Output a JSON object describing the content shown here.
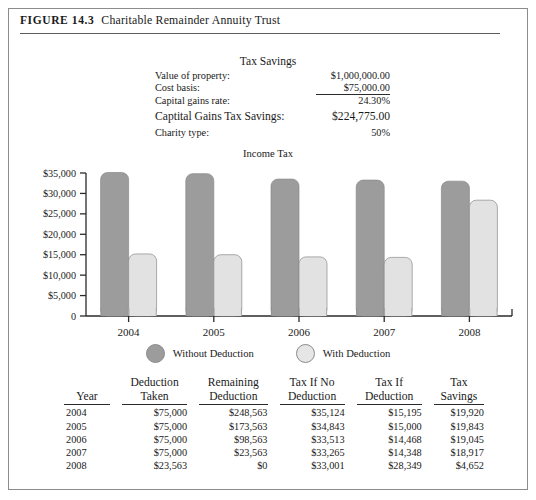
{
  "figure": {
    "number": "FIGURE 14.3",
    "title": "Charitable Remainder Annuity Trust"
  },
  "tax_savings": {
    "title": "Tax Savings",
    "rows": [
      {
        "label": "Value of property:",
        "value": "$1,000,000.00"
      },
      {
        "label": "Cost basis:",
        "value": "$75,000.00"
      },
      {
        "label": "Capital gains rate:",
        "value": "24.30%"
      },
      {
        "label": "Captital Gains Tax Savings:",
        "value": "$224,775.00"
      },
      {
        "label": "Charity type:",
        "value": "50%"
      }
    ]
  },
  "chart_data": {
    "type": "bar",
    "title": "Income Tax",
    "xlabel": "",
    "ylabel": "",
    "categories": [
      "2004",
      "2005",
      "2006",
      "2007",
      "2008"
    ],
    "series": [
      {
        "name": "Without Deduction",
        "color": "#9c9c9c",
        "values": [
          35124,
          34843,
          33513,
          33265,
          33001
        ]
      },
      {
        "name": "With Deduction",
        "color": "#e2e2e2",
        "values": [
          15195,
          15000,
          14468,
          14348,
          28349
        ]
      }
    ],
    "ylim": [
      0,
      35000
    ],
    "yticks": [
      0,
      5000,
      10000,
      15000,
      20000,
      25000,
      30000,
      35000
    ],
    "ytick_labels": [
      "0",
      "$5,000",
      "$10,000",
      "$15,000",
      "$20,000",
      "$25,000",
      "$30,000",
      "$35,000"
    ],
    "grid": false,
    "legend_position": "bottom"
  },
  "legend": [
    {
      "label": "Without Deduction",
      "color": "#9c9c9c"
    },
    {
      "label": "With Deduction",
      "color": "#e6e6e6"
    }
  ],
  "data_table": {
    "headers": [
      {
        "line1": "",
        "line2": "Year"
      },
      {
        "line1": "Deduction",
        "line2": "Taken"
      },
      {
        "line1": "Remaining",
        "line2": "Deduction"
      },
      {
        "line1": "Tax If No",
        "line2": "Deduction"
      },
      {
        "line1": "Tax If",
        "line2": "Deduction"
      },
      {
        "line1": "Tax",
        "line2": "Savings"
      }
    ],
    "rows": [
      {
        "year": "2004",
        "deduction_taken": "$75,000",
        "remaining_deduction": "$248,563",
        "tax_if_no_deduction": "$35,124",
        "tax_if_deduction": "$15,195",
        "tax_savings": "$19,920"
      },
      {
        "year": "2005",
        "deduction_taken": "$75,000",
        "remaining_deduction": "$173,563",
        "tax_if_no_deduction": "$34,843",
        "tax_if_deduction": "$15,000",
        "tax_savings": "$19,843"
      },
      {
        "year": "2006",
        "deduction_taken": "$75,000",
        "remaining_deduction": "$98,563",
        "tax_if_no_deduction": "$33,513",
        "tax_if_deduction": "$14,468",
        "tax_savings": "$19,045"
      },
      {
        "year": "2007",
        "deduction_taken": "$75,000",
        "remaining_deduction": "$23,563",
        "tax_if_no_deduction": "$33,265",
        "tax_if_deduction": "$14,348",
        "tax_savings": "$18,917"
      },
      {
        "year": "2008",
        "deduction_taken": "$23,563",
        "remaining_deduction": "$0",
        "tax_if_no_deduction": "$33,001",
        "tax_if_deduction": "$28,349",
        "tax_savings": "$4,652"
      }
    ]
  },
  "colors": {
    "bar_dark": "#9c9c9c",
    "bar_light": "#e4e4e4",
    "bar_stroke": "#8a8a8a",
    "axis": "#2a2a2a",
    "frame": "#8c8c8c"
  }
}
